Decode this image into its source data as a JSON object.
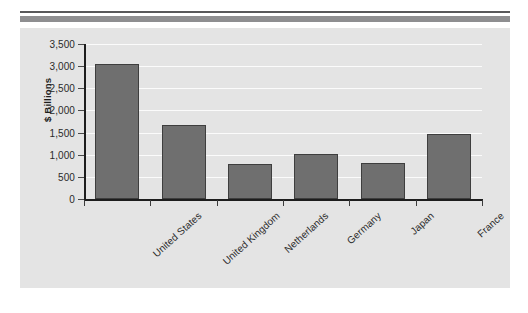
{
  "header": {
    "rule_top_color": "#58585a",
    "rule_bottom_color": "#8e8e90"
  },
  "panel": {
    "background_color": "#e4e4e4",
    "gridline_color": "#fbfbfb",
    "axis_color": "#1d1d1d"
  },
  "chart_data": {
    "type": "bar",
    "title": "",
    "xlabel": "",
    "ylabel": "$ Billions",
    "categories": [
      "United States",
      "United Kingdom",
      "Netherlands",
      "Germany",
      "Japan",
      "France"
    ],
    "values": [
      3040,
      1680,
      790,
      1020,
      810,
      1460
    ],
    "ylim": [
      0,
      3500
    ],
    "ytick_labels": [
      "0",
      "500",
      "1,000",
      "1,500",
      "2,000",
      "2,500",
      "3,000",
      "3,500"
    ],
    "ytick_values": [
      0,
      500,
      1000,
      1500,
      2000,
      2500,
      3000,
      3500
    ],
    "grid": true,
    "legend": "none",
    "bar_color": "#6f6f6f",
    "bar_edge_color": "#3e3e3e"
  }
}
